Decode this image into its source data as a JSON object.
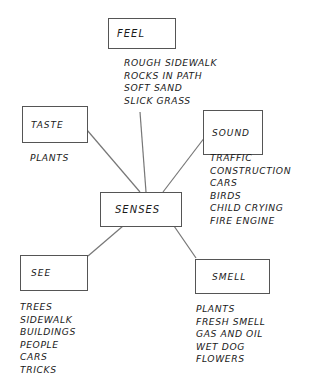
{
  "diagram": {
    "center": {
      "label": "SENSES"
    },
    "nodes": {
      "feel": {
        "label": "FEEL",
        "items": [
          "ROUGH SIDEWALK",
          "ROCKS IN PATH",
          "SOFT SAND",
          "SLICK GRASS"
        ]
      },
      "taste": {
        "label": "TASTE",
        "items": [
          "PLANTS"
        ]
      },
      "sound": {
        "label": "SOUND",
        "items": [
          "TRAFFIC",
          "CONSTRUCTION",
          "CARS",
          "BIRDS",
          "CHILD CRYING",
          "FIRE ENGINE"
        ]
      },
      "see": {
        "label": "SEE",
        "items": [
          "TREES",
          "SIDEWALK",
          "BUILDINGS",
          "PEOPLE",
          "CARS",
          "TRICKS"
        ]
      },
      "smell": {
        "label": "SMELL",
        "items": [
          "PLANTS",
          "FRESH SMELL",
          "GAS AND OIL",
          "WET DOG",
          "FLOWERS"
        ]
      }
    },
    "edges": [
      [
        "SENSES",
        "FEEL"
      ],
      [
        "SENSES",
        "TASTE"
      ],
      [
        "SENSES",
        "SOUND"
      ],
      [
        "SENSES",
        "SEE"
      ],
      [
        "SENSES",
        "SMELL"
      ]
    ],
    "colors": {
      "line": "#777777",
      "box_border": "#555555",
      "text": "#1a1a1a"
    }
  }
}
